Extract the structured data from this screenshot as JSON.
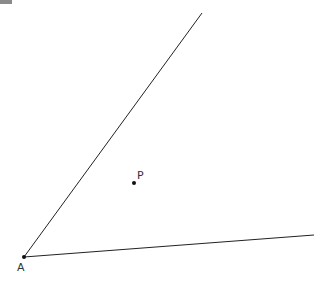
{
  "diagram": {
    "colors": {
      "line": "#222222",
      "point": "#111111",
      "label": "#333333",
      "corner": "#8a8a8a"
    },
    "points": {
      "A": {
        "label": "A",
        "x": 24,
        "y": 257,
        "label_x": 17,
        "label_y": 271
      },
      "P": {
        "label": "P",
        "x": 134,
        "y": 183,
        "label_x": 137,
        "label_y": 179
      }
    },
    "rays": [
      {
        "name": "ray-upper",
        "from": "A",
        "x2": 202,
        "y2": 13
      },
      {
        "name": "ray-lower",
        "from": "A",
        "x2": 314,
        "y2": 235
      }
    ]
  }
}
